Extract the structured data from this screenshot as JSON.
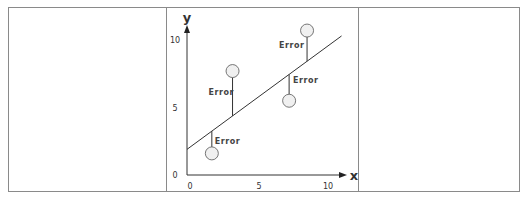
{
  "diagram": {
    "axes": {
      "x_label": "x",
      "y_label": "y",
      "x_ticks": [
        "0",
        "5",
        "10"
      ],
      "y_ticks": [
        "0",
        "5",
        "10"
      ]
    },
    "error_label": "Error",
    "colors": {
      "line": "#333333",
      "point_fill": "#f0f0f0",
      "point_stroke": "#555555",
      "border": "#8a8a8a"
    }
  },
  "chart_data": {
    "type": "scatter",
    "title": "",
    "xlabel": "x",
    "ylabel": "y",
    "xlim": [
      0,
      11
    ],
    "ylim": [
      0,
      11
    ],
    "x_ticks": [
      0,
      5,
      10
    ],
    "y_ticks": [
      0,
      5,
      10
    ],
    "grid": false,
    "points": [
      {
        "x": 1.8,
        "y": 1.6,
        "label": "Error"
      },
      {
        "x": 3.3,
        "y": 7.7,
        "label": "Error"
      },
      {
        "x": 7.4,
        "y": 5.5,
        "label": "Error"
      },
      {
        "x": 8.7,
        "y": 10.7,
        "label": "Error"
      }
    ],
    "regression_line": {
      "intercept": 1.9,
      "slope": 0.75,
      "x_range": [
        0,
        11.2
      ]
    },
    "annotations": [
      "Error",
      "Error",
      "Error",
      "Error"
    ]
  }
}
